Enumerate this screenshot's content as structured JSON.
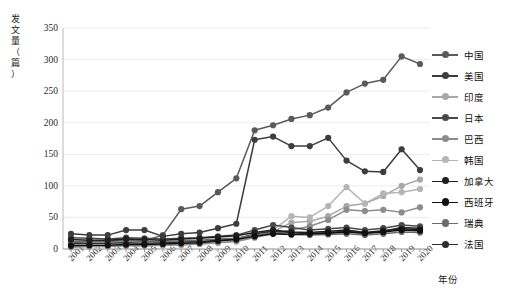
{
  "chart_data": {
    "type": "line",
    "title": "",
    "xlabel": "年份",
    "ylabel": "发文量（篇）",
    "grid": true,
    "legend_position": "right",
    "ylim": [
      0,
      350
    ],
    "yticks": [
      0,
      50,
      100,
      150,
      200,
      250,
      300,
      350
    ],
    "categories": [
      "2001",
      "2002",
      "2003",
      "2004",
      "2005",
      "2006",
      "2007",
      "2008",
      "2009",
      "2010",
      "2011",
      "2012",
      "2013",
      "2014",
      "2015",
      "2016",
      "2017",
      "2018",
      "2019",
      "2020"
    ],
    "series": [
      {
        "name": "中国",
        "color": "#5a5a5a",
        "values": [
          10,
          12,
          13,
          14,
          13,
          22,
          63,
          68,
          90,
          112,
          188,
          196,
          206,
          212,
          224,
          248,
          262,
          268,
          305,
          293
        ]
      },
      {
        "name": "美国",
        "color": "#3d3d3d",
        "values": [
          24,
          22,
          22,
          30,
          30,
          20,
          24,
          26,
          33,
          40,
          173,
          178,
          163,
          163,
          176,
          140,
          123,
          122,
          158,
          125
        ]
      },
      {
        "name": "印度",
        "color": "#a8a8a8",
        "values": [
          4,
          5,
          5,
          6,
          6,
          7,
          8,
          9,
          12,
          15,
          22,
          27,
          42,
          44,
          52,
          68,
          72,
          84,
          100,
          110
        ]
      },
      {
        "name": "日本",
        "color": "#4a4a4a",
        "values": [
          18,
          17,
          16,
          18,
          17,
          16,
          17,
          18,
          20,
          22,
          30,
          38,
          34,
          30,
          32,
          34,
          30,
          33,
          38,
          36
        ]
      },
      {
        "name": "巴西",
        "color": "#8c8c8c",
        "values": [
          3,
          4,
          4,
          5,
          5,
          6,
          7,
          8,
          10,
          12,
          18,
          24,
          30,
          36,
          46,
          62,
          60,
          62,
          58,
          66
        ]
      },
      {
        "name": "韩国",
        "color": "#b5b5b5",
        "values": [
          3,
          4,
          4,
          5,
          5,
          6,
          6,
          8,
          10,
          13,
          20,
          30,
          52,
          50,
          68,
          98,
          72,
          88,
          90,
          95
        ]
      },
      {
        "name": "加拿大",
        "color": "#1f1f1f",
        "values": [
          15,
          14,
          14,
          16,
          15,
          14,
          16,
          17,
          19,
          21,
          26,
          30,
          27,
          26,
          28,
          30,
          26,
          29,
          32,
          31
        ]
      },
      {
        "name": "西班牙",
        "color": "#111111",
        "values": [
          5,
          6,
          6,
          7,
          7,
          8,
          9,
          10,
          13,
          15,
          20,
          24,
          23,
          24,
          25,
          27,
          25,
          27,
          30,
          29
        ]
      },
      {
        "name": "瑞典",
        "color": "#6b6b6b",
        "values": [
          12,
          12,
          12,
          13,
          12,
          12,
          13,
          14,
          16,
          17,
          22,
          25,
          23,
          22,
          23,
          24,
          22,
          24,
          27,
          26
        ]
      },
      {
        "name": "法国",
        "color": "#2e2e2e",
        "values": [
          8,
          9,
          9,
          10,
          9,
          10,
          11,
          12,
          14,
          16,
          24,
          28,
          26,
          24,
          26,
          28,
          25,
          28,
          34,
          33
        ]
      }
    ]
  },
  "axis": {
    "y_label_chars": [
      "发",
      "文",
      "量",
      "（",
      "篇",
      "）"
    ],
    "x_label": "年份"
  }
}
